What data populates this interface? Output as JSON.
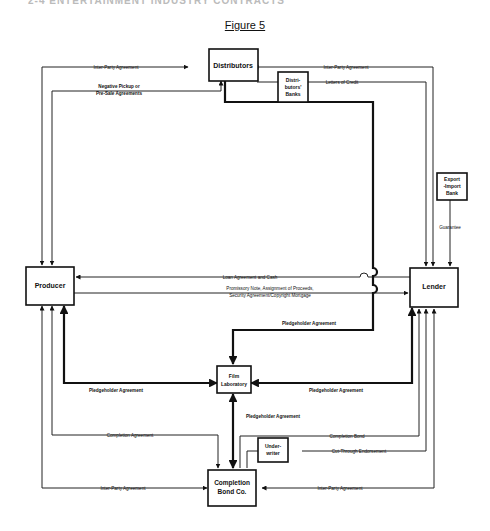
{
  "page_header": "2-4     ENTERTAINMENT INDUSTRY CONTRACTS",
  "figure_title": "Figure 5",
  "nodes": {
    "distributors": "Distributors",
    "distributors_banks": [
      "Distri-",
      "butors'",
      "Banks"
    ],
    "export_import_bank": [
      "Export",
      "-Import",
      "Bank"
    ],
    "producer": "Producer",
    "lender": "Lender",
    "film_laboratory": [
      "Film",
      "Laboratory"
    ],
    "underwriter": [
      "Under-",
      "writer"
    ],
    "completion_bond_co": [
      "Completion",
      "Bond Co."
    ]
  },
  "edges": {
    "producer_distributors_interparty": "Inter-Party Agreement",
    "negative_pickup": [
      "Negative Pickup or",
      "Pre-Sale Agreements"
    ],
    "lender_distributors_interparty": "Inter-Party Agreement",
    "letters_of_credit": "Letters of Credit",
    "guarantee": "Guarantee",
    "loan_agreement": "Loan Agreement and Cash",
    "promissory_note": [
      "Promissory Note, Assignment of Proceeds,",
      "Security Agreement/Copyright Mortgage"
    ],
    "pledgeholder_distributors_lab": "Pledgeholder Agreement",
    "pledgeholder_producer_lab": "Pledgeholder Agreement",
    "pledgeholder_lender_lab": "Pledgeholder Agreement",
    "pledgeholder_bond_lab": "Pledgeholder Agreement",
    "completion_agreement": "Completion Agreement",
    "completion_bond": "Completion Bond",
    "cut_through": "Cut-Through Endorsement",
    "producer_bond_interparty": "Inter-Party Agreement",
    "lender_bond_interparty": "Inter-Party Agreement"
  }
}
